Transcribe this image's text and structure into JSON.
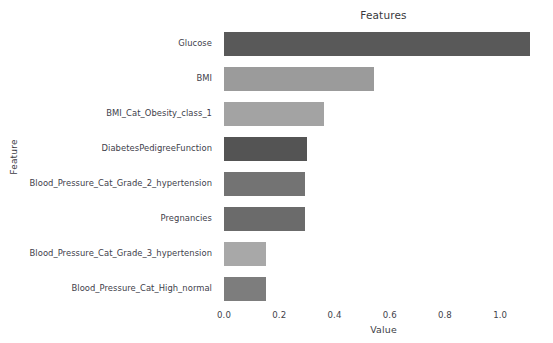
{
  "figure": {
    "background_color": "#ffffff",
    "ghost_top_text": "",
    "ghost_top_text2": ""
  },
  "chart_data": {
    "type": "bar",
    "orientation": "horizontal",
    "title": "Features",
    "xlabel": "Value",
    "ylabel": "Feature",
    "grid": false,
    "legend": false,
    "xlim": [
      0.0,
      1.155
    ],
    "xticks": [
      0.0,
      0.2,
      0.4,
      0.6,
      0.8,
      1.0
    ],
    "xtick_labels": [
      "0.0",
      "0.2",
      "0.4",
      "0.6",
      "0.8",
      "1.0"
    ],
    "categories": [
      "Glucose",
      "BMI",
      "BMI_Cat_Obesity_class_1",
      "DiabetesPedigreeFunction",
      "Blood_Pressure_Cat_Grade_2_hypertension",
      "Pregnancies",
      "Blood_Pressure_Cat_Grade_3_hypertension",
      "Blood_Pressure_Cat_High_normal"
    ],
    "values": [
      1.108,
      0.542,
      0.361,
      0.299,
      0.292,
      0.292,
      0.153,
      0.153
    ],
    "bar_colors": [
      "#595959",
      "#9b9b9b",
      "#a3a3a3",
      "#545454",
      "#737373",
      "#6b6b6b",
      "#a8a8a8",
      "#7d7d7d"
    ]
  }
}
